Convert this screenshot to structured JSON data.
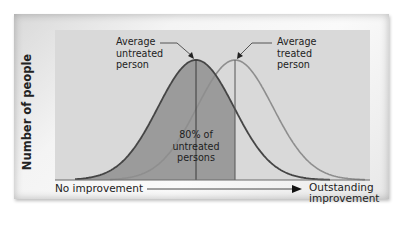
{
  "chart_data": {
    "type": "area",
    "title": "",
    "xlabel_left": "No improvement",
    "xlabel_right": "Outstanding improvement",
    "ylabel": "Number of people",
    "series": [
      {
        "name": "Untreated persons",
        "distribution": "normal",
        "peak_x_relative": 0.45,
        "color": "#4a4a4a"
      },
      {
        "name": "Treated persons",
        "distribution": "normal",
        "peak_x_relative": 0.58,
        "color": "#8c8c8c"
      }
    ],
    "annotations": [
      {
        "text": "Average untreated person",
        "points_to": "peak of untreated curve"
      },
      {
        "text": "Average treated person",
        "points_to": "peak of treated curve"
      },
      {
        "text": "80% of untreated persons",
        "region": "shaded area under untreated curve left of treated mean"
      }
    ],
    "shaded_fraction": 0.8,
    "grid": false,
    "legend": "none"
  },
  "labels": {
    "ylabel": "Number of people",
    "avg_untreated": [
      "Average",
      "untreated",
      "person"
    ],
    "avg_treated": [
      "Average",
      "treated",
      "person"
    ],
    "pct": [
      "80% of",
      "untreated",
      "persons"
    ],
    "x_left": "No improvement",
    "x_right": [
      "Outstanding",
      "improvement"
    ]
  },
  "colors": {
    "plot_bg": "#d8d8d8",
    "shaded": "#9a9a9a",
    "untreated_curve": "#4a4a4a",
    "treated_curve": "#8f8f8f",
    "axis": "#333333"
  }
}
